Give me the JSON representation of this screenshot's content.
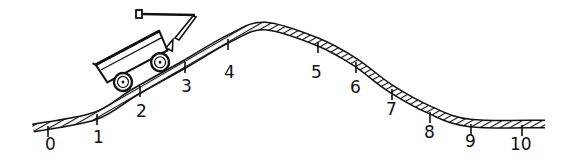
{
  "diagram": {
    "colors": {
      "ink": "#111111",
      "background": "#ffffff"
    },
    "track": {
      "points": [
        [
          33,
          128
        ],
        [
          95,
          116
        ],
        [
          135,
          92
        ],
        [
          185,
          64
        ],
        [
          230,
          38
        ],
        [
          265,
          26
        ],
        [
          318,
          42
        ],
        [
          355,
          62
        ],
        [
          390,
          88
        ],
        [
          430,
          110
        ],
        [
          470,
          123
        ],
        [
          545,
          124
        ]
      ]
    },
    "markers": [
      {
        "label": "0",
        "x": 48,
        "tick_y": 126,
        "label_x": 45,
        "label_y": 150
      },
      {
        "label": "1",
        "x": 97,
        "tick_y": 114,
        "label_x": 93,
        "label_y": 143
      },
      {
        "label": "2",
        "x": 140,
        "tick_y": 86,
        "label_x": 136,
        "label_y": 117
      },
      {
        "label": "3",
        "x": 185,
        "tick_y": 62,
        "label_x": 181,
        "label_y": 92
      },
      {
        "label": "4",
        "x": 228,
        "tick_y": 39,
        "label_x": 224,
        "label_y": 78
      },
      {
        "label": "5",
        "x": 318,
        "tick_y": 42,
        "label_x": 311,
        "label_y": 78
      },
      {
        "label": "6",
        "x": 356,
        "tick_y": 62,
        "label_x": 350,
        "label_y": 93
      },
      {
        "label": "7",
        "x": 392,
        "tick_y": 89,
        "label_x": 386,
        "label_y": 115
      },
      {
        "label": "8",
        "x": 430,
        "tick_y": 112,
        "label_x": 424,
        "label_y": 138
      },
      {
        "label": "9",
        "x": 471,
        "tick_y": 124,
        "label_x": 465,
        "label_y": 147
      },
      {
        "label": "10",
        "x": 522,
        "tick_y": 125,
        "label_x": 510,
        "label_y": 150
      }
    ],
    "wagon": {
      "position_label": "between 1 and 3",
      "rotation_deg": -28
    }
  }
}
